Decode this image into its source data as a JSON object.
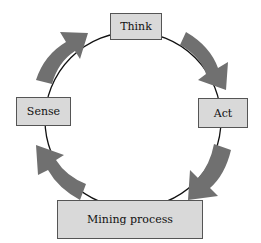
{
  "diagram": {
    "type": "cycle",
    "nodes": [
      {
        "id": "think",
        "label": "Think"
      },
      {
        "id": "act",
        "label": "Act"
      },
      {
        "id": "mining",
        "label": "Mining process"
      },
      {
        "id": "sense",
        "label": "Sense"
      }
    ],
    "edges": [
      {
        "from": "sense",
        "to": "think"
      },
      {
        "from": "think",
        "to": "act"
      },
      {
        "from": "act",
        "to": "mining"
      },
      {
        "from": "mining",
        "to": "sense"
      }
    ],
    "colors": {
      "box_fill": "#d9d9d9",
      "box_border": "#555555",
      "arrow_fill": "#707070",
      "circle_stroke": "#111111"
    }
  }
}
